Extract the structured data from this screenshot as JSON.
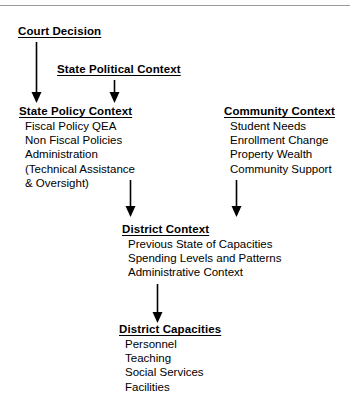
{
  "figure": {
    "background_color": "#ffffff",
    "text_color": "#000000",
    "rule_color": "#9a9a9a"
  },
  "nodes": {
    "court_decision": {
      "title": "Court Decision",
      "items": []
    },
    "state_political_context": {
      "title": "State Political Context",
      "items": []
    },
    "state_policy_context": {
      "title": "State Policy Context",
      "items": [
        "Fiscal Policy QEA",
        "Non Fiscal Policies",
        "Administration",
        " (Technical Assistance",
        "  & Oversight)"
      ]
    },
    "community_context": {
      "title": "Community Context",
      "items": [
        "Student Needs",
        "Enrollment Change",
        "Property Wealth",
        "Community Support"
      ]
    },
    "district_context": {
      "title": "District Context",
      "items": [
        "Previous State of Capacities",
        "Spending Levels and Patterns",
        "Administrative Context"
      ]
    },
    "district_capacities": {
      "title": "District Capacities",
      "items": [
        "Personnel",
        "Teaching",
        "Social Services",
        "Facilities"
      ]
    }
  },
  "arrows": [
    {
      "name": "court-decision-to-state-policy-context",
      "from": "court_decision",
      "to": "state_policy_context"
    },
    {
      "name": "state-political-context-to-state-policy-context",
      "from": "state_political_context",
      "to": "state_policy_context"
    },
    {
      "name": "state-policy-context-to-district-context",
      "from": "state_policy_context",
      "to": "district_context"
    },
    {
      "name": "community-context-to-district-context",
      "from": "community_context",
      "to": "district_context"
    },
    {
      "name": "district-context-to-district-capacities",
      "from": "district_context",
      "to": "district_capacities"
    }
  ]
}
